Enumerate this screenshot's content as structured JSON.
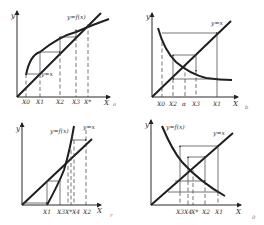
{
  "figure": {
    "panels": [
      {
        "id": "a",
        "caption": "a",
        "curve_label": "y=f(x)",
        "line_label": "y=x",
        "y_axis_label": "y",
        "x_axis_label": "X",
        "ticks": [
          "X0",
          "X1",
          "X2",
          "X3",
          "X*"
        ],
        "behavior": "monotone convergence (staircase)"
      },
      {
        "id": "b",
        "caption": "b",
        "line_label": "y=x",
        "y_axis_label": "y",
        "x_axis_label": "X",
        "ticks": [
          "X0",
          "X2",
          "α",
          "X3",
          "X1"
        ],
        "behavior": "oscillating convergence (cobweb)"
      },
      {
        "id": "c",
        "caption": "r",
        "curve_label": "y=f(x)",
        "line_label": "y=x",
        "y_axis_label": "y",
        "x_axis_label": "X",
        "ticks": [
          "X1",
          "X3",
          "X*",
          "X4",
          "X2"
        ],
        "behavior": "monotone divergence"
      },
      {
        "id": "d",
        "caption": "д",
        "curve_label": "y=f(x)",
        "line_label": "y=x",
        "y_axis_label": "y",
        "x_axis_label": "X",
        "ticks": [
          "X3",
          "X4",
          "X*",
          "X2",
          "X1"
        ],
        "behavior": "oscillating divergence (cobweb)"
      }
    ]
  }
}
